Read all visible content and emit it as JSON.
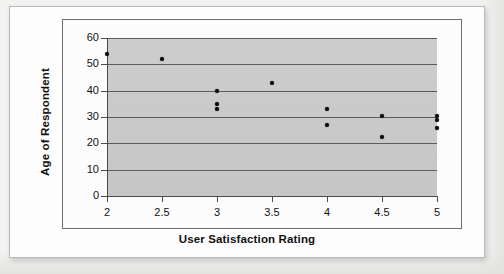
{
  "chart_data": {
    "type": "scatter",
    "title": "",
    "xlabel": "User Satisfaction Rating",
    "ylabel": "Age of Respondent",
    "xlim": [
      2,
      5
    ],
    "ylim": [
      0,
      60
    ],
    "grid": true,
    "legend": false,
    "legend_position": "none",
    "xticks": [
      "2",
      "2.5",
      "3",
      "3.5",
      "4",
      "4.5",
      "5"
    ],
    "xtick_values": [
      2,
      2.5,
      3,
      3.5,
      4,
      4.5,
      5
    ],
    "yticks": [
      "0",
      "10",
      "20",
      "30",
      "40",
      "50",
      "60"
    ],
    "ytick_values": [
      0,
      10,
      20,
      30,
      40,
      50,
      60
    ],
    "marker": "filled-circle",
    "marker_color": "#0d0d0d",
    "plot_background": "#c9c9c9",
    "gridline_color": "#5c5c5c",
    "points": [
      {
        "x": 2,
        "y": 54
      },
      {
        "x": 2.5,
        "y": 52
      },
      {
        "x": 3,
        "y": 40
      },
      {
        "x": 3,
        "y": 35
      },
      {
        "x": 3,
        "y": 33
      },
      {
        "x": 3.5,
        "y": 43
      },
      {
        "x": 4,
        "y": 33
      },
      {
        "x": 4,
        "y": 27
      },
      {
        "x": 4.5,
        "y": 30.5
      },
      {
        "x": 4.5,
        "y": 22.5
      },
      {
        "x": 5,
        "y": 30.5
      },
      {
        "x": 5,
        "y": 29
      },
      {
        "x": 5,
        "y": 26
      }
    ]
  }
}
